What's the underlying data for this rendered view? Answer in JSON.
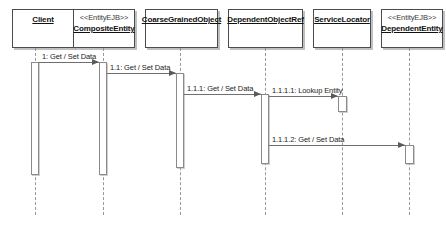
{
  "diagram": {
    "type": "uml-sequence-diagram",
    "colors": {
      "background": "#ffffff",
      "box_border": "#4c4c4c",
      "lifeline": "#9a9a9a",
      "message": "#6f6f6f",
      "activation_border": "#8a8a8a",
      "text": "#111111"
    }
  },
  "participants": [
    {
      "id": "client",
      "stereotype": "",
      "name": "Client",
      "x": 12,
      "y": 9,
      "w": 62,
      "h": 39,
      "lifeline_x": 35,
      "lifeline_bottom": 215,
      "activation": {
        "x": 31,
        "y": 62,
        "w": 8,
        "h": 113
      }
    },
    {
      "id": "composite-entity",
      "stereotype": "<<EntityEJB>>",
      "name": "CompositeEntity",
      "x": 73,
      "y": 9,
      "w": 62,
      "h": 39,
      "lifeline_x": 103,
      "lifeline_bottom": 215,
      "activation": {
        "x": 99,
        "y": 62,
        "w": 8,
        "h": 113
      }
    },
    {
      "id": "coarse-grained-object",
      "stereotype": "",
      "name": "CoarseGrainedObject",
      "x": 145,
      "y": 9,
      "w": 73,
      "h": 39,
      "lifeline_x": 180,
      "lifeline_bottom": 215,
      "activation": {
        "x": 176,
        "y": 73,
        "w": 8,
        "h": 95
      }
    },
    {
      "id": "dependent-object-ref",
      "stereotype": "",
      "name": "DependentObjectRef",
      "x": 228,
      "y": 9,
      "w": 75,
      "h": 39,
      "lifeline_x": 265,
      "lifeline_bottom": 215,
      "activation": {
        "x": 261,
        "y": 94,
        "w": 8,
        "h": 70
      }
    },
    {
      "id": "service-locator",
      "stereotype": "",
      "name": "ServiceLocator",
      "x": 313,
      "y": 9,
      "w": 58,
      "h": 39,
      "lifeline_x": 342,
      "lifeline_bottom": 215,
      "activation": {
        "x": 338,
        "y": 96,
        "w": 9,
        "h": 16
      }
    },
    {
      "id": "dependent-entity",
      "stereotype": "<<EntityEJB>>",
      "name": "DependentEntity",
      "x": 381,
      "y": 9,
      "w": 62,
      "h": 39,
      "lifeline_x": 409,
      "lifeline_bottom": 215,
      "activation": {
        "x": 405,
        "y": 145,
        "w": 9,
        "h": 19
      }
    }
  ],
  "messages": [
    {
      "id": "msg-1",
      "label": "1: Get / Set Data",
      "from": "client",
      "to": "composite-entity",
      "y": 62,
      "x1": 39,
      "x2": 99,
      "label_x": 42,
      "label_y": 52
    },
    {
      "id": "msg-1-1",
      "label": "1.1: Get / Set Data",
      "from": "composite-entity",
      "to": "coarse-grained-object",
      "y": 73,
      "x1": 107,
      "x2": 176,
      "label_x": 110,
      "label_y": 63
    },
    {
      "id": "msg-1-1-1",
      "label": "1.1.1: Get / Set Data",
      "from": "coarse-grained-object",
      "to": "dependent-object-ref",
      "y": 94,
      "x1": 184,
      "x2": 261,
      "label_x": 187,
      "label_y": 84
    },
    {
      "id": "msg-1-1-1-1",
      "label": "1.1.1.1: Lookup Entity",
      "from": "dependent-object-ref",
      "to": "service-locator",
      "y": 96,
      "x1": 269,
      "x2": 338,
      "label_x": 272,
      "label_y": 86
    },
    {
      "id": "msg-1-1-1-2",
      "label": "1.1.1.2: Get / Set Data",
      "from": "dependent-object-ref",
      "to": "dependent-entity",
      "y": 145,
      "x1": 269,
      "x2": 405,
      "label_x": 272,
      "label_y": 135
    }
  ]
}
